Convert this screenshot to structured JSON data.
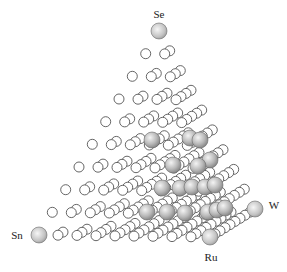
{
  "diagram": {
    "type": "quaternary-composition-tetrahedron",
    "divisions": 9,
    "vertices": [
      {
        "id": "Se",
        "label": "Se",
        "x": 159,
        "y": 31,
        "label_x": 159,
        "label_y": 18,
        "anchor": "middle"
      },
      {
        "id": "Sn",
        "label": "Sn",
        "x": 39,
        "y": 235,
        "label_x": 17,
        "label_y": 239,
        "anchor": "middle"
      },
      {
        "id": "Ru",
        "label": "Ru",
        "x": 210,
        "y": 237,
        "label_x": 211,
        "label_y": 261,
        "anchor": "middle"
      },
      {
        "id": "W",
        "label": "W",
        "x": 255,
        "y": 209,
        "label_x": 274,
        "label_y": 209,
        "anchor": "middle"
      }
    ],
    "vertex_radius": 8,
    "lattice_radius": 5,
    "highlight_radius": 8,
    "colors": {
      "lattice_fill": "#ffffff",
      "lattice_stroke": "#555555",
      "sphere_light": "#f2f2f2",
      "sphere_mid": "#b8b8b8",
      "sphere_dark": "#7a7a7a",
      "sphere_stroke": "#6a6a6a"
    },
    "highlighted_points": [
      {
        "x": 152,
        "y": 140
      },
      {
        "x": 190,
        "y": 138
      },
      {
        "x": 200,
        "y": 140
      },
      {
        "x": 210,
        "y": 160
      },
      {
        "x": 173,
        "y": 165
      },
      {
        "x": 198,
        "y": 166
      },
      {
        "x": 162,
        "y": 188
      },
      {
        "x": 180,
        "y": 188
      },
      {
        "x": 192,
        "y": 187
      },
      {
        "x": 205,
        "y": 187
      },
      {
        "x": 215,
        "y": 185
      },
      {
        "x": 147,
        "y": 212
      },
      {
        "x": 167,
        "y": 212
      },
      {
        "x": 185,
        "y": 213
      },
      {
        "x": 208,
        "y": 212
      },
      {
        "x": 217,
        "y": 210
      },
      {
        "x": 225,
        "y": 208
      }
    ]
  }
}
